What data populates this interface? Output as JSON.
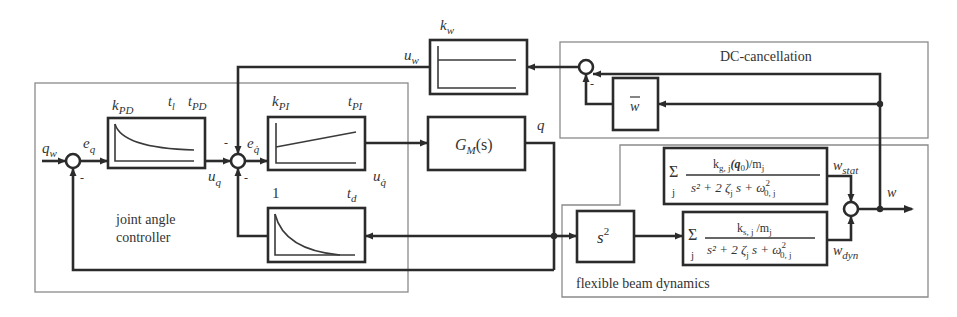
{
  "groups": {
    "joint_controller": {
      "label_line1": "joint angle",
      "label_line2": "controller"
    },
    "dc_cancellation": {
      "label": "DC-cancellation"
    },
    "beam_dynamics": {
      "label": "flexible beam dynamics"
    }
  },
  "signals": {
    "q_w": {
      "base": "q",
      "sub": "w"
    },
    "e_q": {
      "base": "e",
      "sub": "q"
    },
    "u_q": {
      "base": "u",
      "sub": "q"
    },
    "e_qdot": {
      "base": "e",
      "sub": "q̇"
    },
    "u_qdot": {
      "base": "u",
      "sub": "q̇"
    },
    "u_w": {
      "base": "u",
      "sub": "w"
    },
    "q": {
      "base": "q"
    },
    "w": {
      "base": "w"
    },
    "w_stat": {
      "base": "w",
      "sub": "stat"
    },
    "w_dyn": {
      "base": "w",
      "sub": "dyn"
    }
  },
  "blocks": {
    "k_pd": {
      "gain_base": "k",
      "gain_sub": "PD",
      "t1_base": "t",
      "t1_sub": "l",
      "t2_base": "t",
      "t2_sub": "PD"
    },
    "k_pi": {
      "gain_base": "k",
      "gain_sub": "PI",
      "t_base": "t",
      "t_sub": "PI"
    },
    "g_m": {
      "base": "G",
      "sub": "M",
      "arg": "(s)"
    },
    "k_w": {
      "gain_base": "k",
      "gain_sub": "w"
    },
    "w_bar": {
      "label": "w"
    },
    "t_d": {
      "gain": "1",
      "t_base": "t",
      "t_sub": "d"
    },
    "s2": {
      "base": "s",
      "sup": "2"
    },
    "stat_tf": {
      "sum": "Σ",
      "index": "j",
      "numerator": "k",
      "numerator_sub": "g, j",
      "numerator_arg": "(q",
      "numerator_arg_sub": "0",
      "numerator_tail": ")/m",
      "numerator_tail_sub": "j",
      "denominator": "s² + 2 ζ",
      "denominator_sub": "j",
      "denominator_mid": " s + ω",
      "denominator_sup": "2",
      "denominator_sub2": "0, j"
    },
    "dyn_tf": {
      "sum": "Σ",
      "index": "j",
      "numerator": "k",
      "numerator_sub": "s, j",
      "numerator_tail": " /m",
      "numerator_tail_sub": "j",
      "denominator": "s² + 2 ζ",
      "denominator_sub": "j",
      "denominator_mid": " s + ω",
      "denominator_sup": "2",
      "denominator_sub2": "0, j"
    }
  },
  "sum_signs": {
    "minus": "-"
  }
}
